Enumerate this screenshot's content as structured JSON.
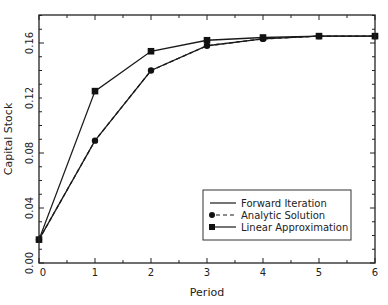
{
  "chart_data": {
    "type": "line",
    "title": "",
    "xlabel": "Period",
    "ylabel": "Capital Stock",
    "x": [
      0,
      1,
      2,
      3,
      4,
      5,
      6
    ],
    "xlim": [
      0,
      6
    ],
    "ylim": [
      0,
      0.18
    ],
    "xticks": [
      "0",
      "1",
      "2",
      "3",
      "4",
      "5",
      "6"
    ],
    "yticks": [
      "0.00",
      "0.04",
      "0.08",
      "0.12",
      "0.16"
    ],
    "ytick_values": [
      0,
      0.04,
      0.08,
      0.12,
      0.16
    ],
    "grid": false,
    "legend_position": "lower right",
    "series": [
      {
        "name": "Forward Iteration",
        "style": "solid",
        "marker": "none",
        "values": [
          0.017,
          0.089,
          0.14,
          0.158,
          0.163,
          0.165,
          0.165
        ]
      },
      {
        "name": "Analytic Solution",
        "style": "dashed",
        "marker": "circle",
        "values": [
          0.017,
          0.089,
          0.14,
          0.158,
          0.163,
          0.165,
          0.165
        ]
      },
      {
        "name": "Linear Approximation",
        "style": "solid",
        "marker": "square",
        "values": [
          0.017,
          0.125,
          0.154,
          0.162,
          0.164,
          0.165,
          0.165
        ]
      }
    ]
  },
  "colors": {
    "line": "#1a1a1a",
    "axis": "#222222",
    "background": "#ffffff"
  }
}
